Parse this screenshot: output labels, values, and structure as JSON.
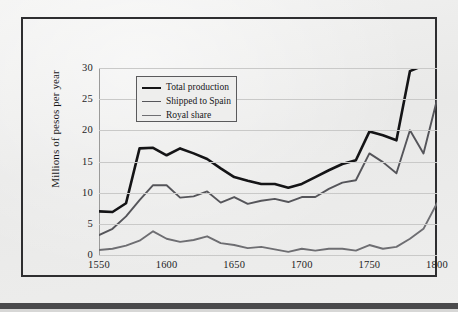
{
  "figure": {
    "frame_color": "#2e2e30",
    "page_background": "#ececeb"
  },
  "chart_data": {
    "type": "line",
    "title": "",
    "subtitle": "",
    "xlabel": "",
    "ylabel": "Millions of pesos per year",
    "xlim": [
      1550,
      1800
    ],
    "ylim": [
      0,
      30
    ],
    "xticks": [
      1550,
      1600,
      1650,
      1700,
      1750,
      1800
    ],
    "yticks": [
      0,
      5,
      10,
      15,
      20,
      25,
      30
    ],
    "grid": "horizontal",
    "legend_position": "upper-left-inside",
    "x": [
      1550,
      1560,
      1570,
      1580,
      1590,
      1600,
      1610,
      1620,
      1630,
      1640,
      1650,
      1660,
      1670,
      1680,
      1690,
      1700,
      1710,
      1720,
      1730,
      1740,
      1750,
      1760,
      1770,
      1780,
      1790,
      1800
    ],
    "series": [
      {
        "name": "Total production",
        "color": "#141416",
        "width": 2.6,
        "values": [
          7.0,
          6.9,
          8.3,
          17.1,
          17.2,
          16.0,
          17.1,
          16.3,
          15.4,
          13.9,
          12.5,
          11.9,
          11.4,
          11.4,
          10.8,
          11.4,
          12.5,
          13.6,
          14.6,
          15.2,
          19.8,
          19.2,
          18.4,
          29.5,
          30.4,
          30.5
        ]
      },
      {
        "name": "Shipped to Spain",
        "color": "#55555a",
        "width": 1.9,
        "values": [
          3.2,
          4.2,
          6.2,
          8.8,
          11.2,
          11.2,
          9.2,
          9.4,
          10.2,
          8.4,
          9.3,
          8.2,
          8.7,
          9.0,
          8.5,
          9.3,
          9.3,
          10.6,
          11.6,
          12.0,
          16.3,
          14.9,
          13.1,
          20.0,
          16.3,
          24.9
        ]
      },
      {
        "name": "Royal share",
        "color": "#6e6e72",
        "width": 1.9,
        "values": [
          0.8,
          1.0,
          1.5,
          2.3,
          3.8,
          2.6,
          2.1,
          2.4,
          3.0,
          1.9,
          1.6,
          1.1,
          1.3,
          0.9,
          0.5,
          1.0,
          0.7,
          1.0,
          1.0,
          0.7,
          1.6,
          1.0,
          1.3,
          2.6,
          4.2,
          8.3
        ]
      }
    ],
    "legend": [
      {
        "label": "Total production",
        "color": "#141416",
        "width": 2.6
      },
      {
        "label": "Shipped to Spain",
        "color": "#55555a",
        "width": 1.9
      },
      {
        "label": "Royal share",
        "color": "#6e6e72",
        "width": 1.9
      }
    ]
  }
}
